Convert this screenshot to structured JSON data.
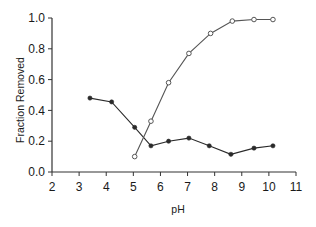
{
  "chart_data": {
    "type": "line",
    "title": "",
    "xlabel": "pH",
    "ylabel": "Fraction Removed",
    "xlim": [
      2,
      11
    ],
    "ylim": [
      0.0,
      1.0
    ],
    "xticks": [
      "2",
      "3",
      "4",
      "5",
      "6",
      "7",
      "8",
      "9",
      "10",
      "11"
    ],
    "yticks": [
      "0.0",
      "0.2",
      "0.4",
      "0.6",
      "0.8",
      "1.0"
    ],
    "grid": false,
    "legend": null,
    "series": [
      {
        "name": "filled-markers",
        "marker": "filled-circle",
        "color": "#2a2a2a",
        "x": [
          3.4,
          4.2,
          5.05,
          5.65,
          6.3,
          7.05,
          7.8,
          8.6,
          9.45,
          10.15
        ],
        "y": [
          0.48,
          0.455,
          0.29,
          0.17,
          0.2,
          0.22,
          0.17,
          0.115,
          0.155,
          0.17
        ]
      },
      {
        "name": "open-markers",
        "marker": "open-circle",
        "color": "#555555",
        "x": [
          5.05,
          5.65,
          6.3,
          7.05,
          7.85,
          8.65,
          9.45,
          10.15
        ],
        "y": [
          0.1,
          0.33,
          0.58,
          0.77,
          0.9,
          0.98,
          0.99,
          0.99
        ]
      }
    ]
  }
}
